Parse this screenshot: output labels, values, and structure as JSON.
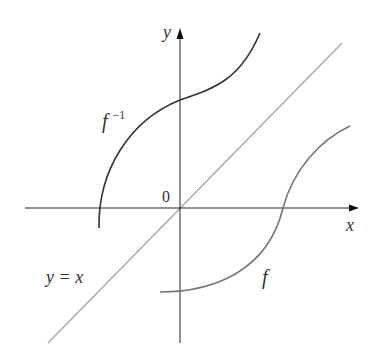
{
  "figure": {
    "axes": {
      "x_label": "x",
      "y_label": "y",
      "origin_label": "0"
    },
    "curves": [
      {
        "id": "f",
        "label": "f",
        "color": "#777777"
      },
      {
        "id": "f-inverse",
        "label_base": "f",
        "label_sup": "−1",
        "color": "#333333"
      },
      {
        "id": "identity-line",
        "label": "y = x",
        "color": "#aaaaaa"
      }
    ],
    "colors": {
      "axis": "#222222",
      "f": "#777777",
      "f_inverse": "#333333",
      "identity": "#aaaaaa",
      "text": "#333333"
    }
  }
}
